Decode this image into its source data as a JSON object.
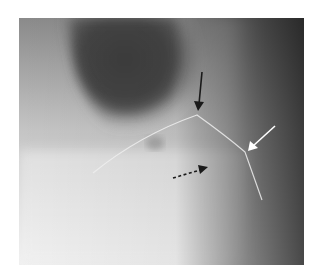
{
  "figure": {
    "type": "radiograph",
    "tones": {
      "lightest": "#f2f2f2",
      "light": "#d9d9d9",
      "mid": "#9a9a9a",
      "dark_lobe": "#4a4a4a",
      "right_edge": "#3a3a3a",
      "wire": "#eeeeee"
    },
    "annotations": [
      {
        "id": "black-arrow",
        "style": "solid",
        "color": "#1a1a1a",
        "from": [
          202,
          72
        ],
        "to": [
          198,
          110
        ]
      },
      {
        "id": "white-arrow",
        "style": "solid",
        "color": "#ffffff",
        "from": [
          275,
          126
        ],
        "to": [
          248,
          151
        ]
      },
      {
        "id": "dashed-arrow",
        "style": "dashed",
        "color": "#1a1a1a",
        "from": [
          173,
          178
        ],
        "to": [
          208,
          167
        ]
      }
    ]
  },
  "caption": {
    "text": ""
  }
}
